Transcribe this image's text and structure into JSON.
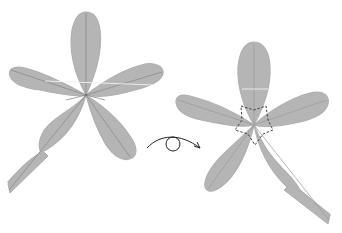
{
  "diagram": {
    "type": "origami-instruction",
    "steps": [
      {
        "name": "flower-before",
        "description": "five-petal flower, front side with crease lines"
      },
      {
        "name": "flower-after",
        "description": "five-petal flower, turned over, dashed star-shaped fold guide at center"
      }
    ],
    "action_symbol": "turn-over-arrow",
    "colors": {
      "paper": "#b3b3b3",
      "crease": "#8c8c8c",
      "highlight": "#eeeeee",
      "dashed": "#333333",
      "arrow": "#222222"
    }
  }
}
